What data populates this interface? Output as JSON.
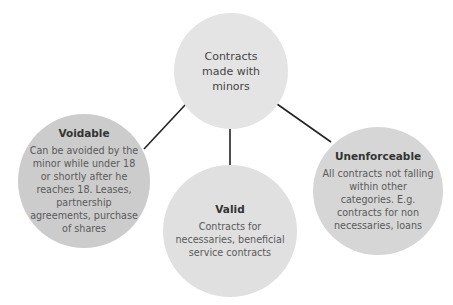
{
  "diagram": {
    "root": {
      "label": "Contracts made with minors",
      "lines": [
        "Contracts",
        "made with",
        "minors"
      ],
      "color": "#e4e4e4"
    },
    "children": [
      {
        "title": "Voidable",
        "lines": [
          "Can be avoided by the",
          "minor while under 18",
          "or shortly after he",
          "reaches 18. Leases,",
          "partnership",
          "agreements, purchase",
          "of shares"
        ],
        "color": "#cccccc"
      },
      {
        "title": "Valid",
        "lines": [
          "Contracts for",
          "necessaries, beneficial",
          "service contracts"
        ],
        "color": "#e0e0e0"
      },
      {
        "title": "Unenforceable",
        "lines": [
          "All contracts not falling",
          "within other",
          "categories. E.g.",
          "contracts for non",
          "necessaries, loans"
        ],
        "color": "#d6d6d6"
      }
    ],
    "connector_color": "#222222"
  }
}
